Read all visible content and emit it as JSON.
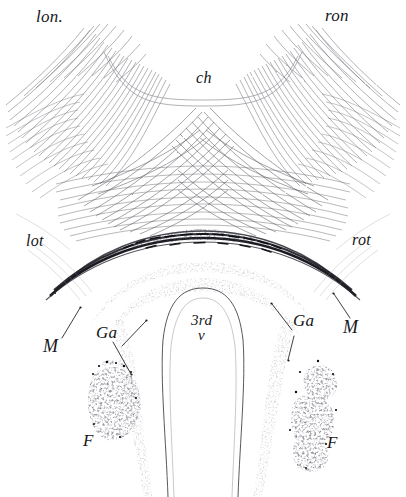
{
  "figure": {
    "background_color": "#ffffff",
    "ink_color": "#16161a",
    "fiber_color": "#4a4a52",
    "blob_color": "#14141a",
    "width": 406,
    "height": 497
  },
  "labels": {
    "left_optic_nerve": "lon.",
    "right_optic_nerve": "ron",
    "chiasm": "ch",
    "left_optic_tract": "lot",
    "right_optic_tract": "rot",
    "third_ventricle_line1": "3rd",
    "third_ventricle_line2": "v",
    "ganglion_left": "Ga",
    "ganglion_right": "Ga",
    "m_left": "M",
    "m_right": "M",
    "f_left": "F",
    "f_right": "F"
  }
}
